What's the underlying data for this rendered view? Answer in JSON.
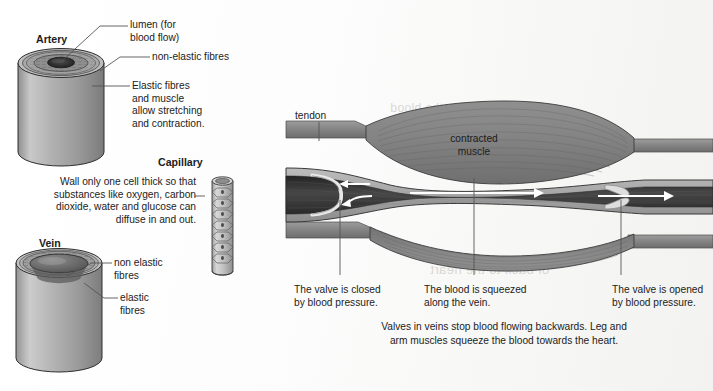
{
  "figure": {
    "background_color": "#ffffff"
  },
  "palette": {
    "vessel_wall": "#9a9a9a",
    "vessel_wall_dark": "#6f6f6f",
    "muscle": "#8a8a8a",
    "muscle_dark": "#6e6e6e",
    "blood_dark": "#3b3b3b",
    "lumen_dark": "#2e2e2e",
    "outline": "#2a2a2a",
    "arrow_white": "#ffffff",
    "leader_line": "#555555",
    "text": "#1c1c1c"
  },
  "left_panel": {
    "artery": {
      "heading": "Artery",
      "labels": [
        {
          "id": "lumen",
          "text": "lumen (for\nblood flow)"
        },
        {
          "id": "non-elastic-fibres",
          "text": "non-elastic fibres"
        },
        {
          "id": "elastic-fibres",
          "text": "Elastic fibres\nand muscle\nallow stretching\nand contraction."
        }
      ]
    },
    "capillary": {
      "heading": "Capillary",
      "description": "Wall only one cell thick so that\nsubstances like oxygen, carbon\ndioxide, water and glucose can\ndiffuse in and out."
    },
    "vein": {
      "heading": "Vein",
      "labels": [
        {
          "id": "non-elastic-fibres",
          "text": "non elastic\nfibres"
        },
        {
          "id": "elastic-fibres",
          "text": "elastic\nfibres"
        }
      ]
    }
  },
  "right_panel": {
    "tendon_label": "tendon",
    "muscle_label": "contracted\nmuscle",
    "callouts": [
      {
        "id": "left-valve",
        "text": "The valve is closed\nby blood pressure."
      },
      {
        "id": "middle-vein",
        "text": "The blood is squeezed\nalong the vein."
      },
      {
        "id": "right-valve",
        "text": "The valve is opened\nby blood pressure."
      }
    ],
    "caption": "Valves in veins stop blood flowing backwards. Leg and\narm muscles squeeze the blood towards the heart.",
    "flow_arrows": [
      {
        "id": "backflow-upper",
        "direction": "left"
      },
      {
        "id": "backflow-lower",
        "direction": "left"
      },
      {
        "id": "forward-middle",
        "direction": "right"
      },
      {
        "id": "forward-right",
        "direction": "right"
      }
    ]
  },
  "bleed_through": {
    "line_top": "A valve in the blood",
    "line_mid": "of back to the heart"
  }
}
